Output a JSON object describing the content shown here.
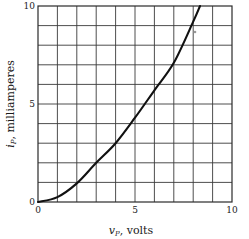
{
  "chart_data": {
    "type": "line",
    "title": "",
    "xlabel": "v_P, volts",
    "ylabel": "i_P, milliamperes",
    "xlim": [
      0,
      10
    ],
    "ylim": [
      0,
      10
    ],
    "grid": true,
    "x_ticks": [
      "0",
      "5",
      "10"
    ],
    "y_ticks": [
      "0",
      "5",
      "10"
    ],
    "x_grid_step": 1,
    "y_grid_step": 1,
    "series": [
      {
        "name": "plate current vs plate voltage",
        "x": [
          0,
          1,
          2,
          3,
          4,
          5,
          6,
          7,
          8,
          8.35
        ],
        "y": [
          0,
          0.25,
          0.95,
          2.0,
          3.0,
          4.3,
          5.7,
          7.1,
          9.2,
          10.0
        ]
      }
    ]
  },
  "labels": {
    "x_axis_main": "v",
    "x_axis_sub": "P",
    "x_axis_unit": ", volts",
    "y_axis_main": "i",
    "y_axis_sub": "P",
    "y_axis_unit": ", milliamperes"
  },
  "colors": {
    "grid": "#3a3a3a",
    "curve": "#111111",
    "background": "#ffffff"
  }
}
